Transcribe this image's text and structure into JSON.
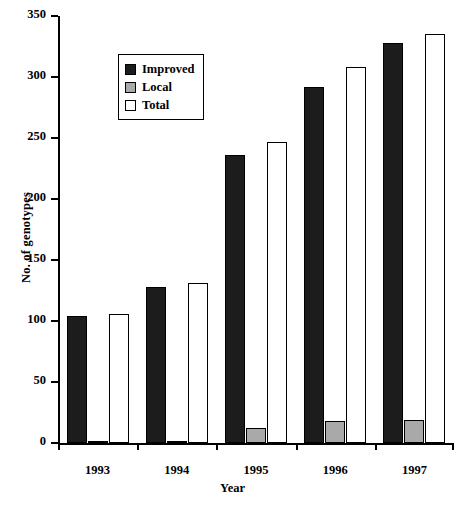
{
  "chart_data": {
    "type": "bar",
    "title": "",
    "xlabel": "Year",
    "ylabel": "No. of genotypes",
    "categories": [
      "1993",
      "1994",
      "1995",
      "1996",
      "1997"
    ],
    "ylim": [
      0,
      350
    ],
    "yticks": [
      0,
      50,
      100,
      150,
      200,
      250,
      300,
      350
    ],
    "grid": false,
    "legend_position": "upper-left-inside",
    "series": [
      {
        "name": "Improved",
        "color": "#1c1c1c",
        "values": [
          104,
          128,
          236,
          292,
          328
        ]
      },
      {
        "name": "Local",
        "color": "#a9a9a9",
        "values": [
          2,
          2,
          12,
          18,
          19
        ]
      },
      {
        "name": "Total",
        "color": "#ffffff",
        "values": [
          106,
          131,
          247,
          308,
          335
        ]
      }
    ]
  },
  "legend": {
    "items": [
      {
        "label": "Improved",
        "swatch": "black-square-icon"
      },
      {
        "label": "Local",
        "swatch": "gray-square-icon"
      },
      {
        "label": "Total",
        "swatch": "white-square-icon"
      }
    ]
  }
}
